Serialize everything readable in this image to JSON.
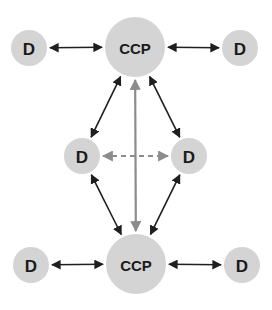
{
  "diagram": {
    "colors": {
      "node_fill": "#d4d4d4",
      "arrow_dark": "#1f1f1f",
      "arrow_gray": "#8c8c8c",
      "background": "#ffffff"
    },
    "nodes": [
      {
        "id": "d-top-left",
        "label": "D",
        "cx": 29,
        "cy": 48,
        "r": 18
      },
      {
        "id": "ccp-top",
        "label": "CCP",
        "cx": 135,
        "cy": 47,
        "r": 30
      },
      {
        "id": "d-top-right",
        "label": "D",
        "cx": 240,
        "cy": 48,
        "r": 18
      },
      {
        "id": "d-mid-left",
        "label": "D",
        "cx": 82,
        "cy": 156,
        "r": 18
      },
      {
        "id": "d-mid-right",
        "label": "D",
        "cx": 189,
        "cy": 156,
        "r": 18
      },
      {
        "id": "d-bottom-left",
        "label": "D",
        "cx": 31,
        "cy": 265,
        "r": 18
      },
      {
        "id": "ccp-bottom",
        "label": "CCP",
        "cx": 136,
        "cy": 264,
        "r": 30
      },
      {
        "id": "d-bottom-right",
        "label": "D",
        "cx": 242,
        "cy": 265,
        "r": 18
      }
    ],
    "edges": [
      {
        "from": "d-top-left",
        "to": "ccp-top",
        "style": "solid-dark",
        "bidirectional": true
      },
      {
        "from": "ccp-top",
        "to": "d-top-right",
        "style": "solid-dark",
        "bidirectional": true
      },
      {
        "from": "ccp-top",
        "to": "d-mid-left",
        "style": "solid-dark",
        "bidirectional": true
      },
      {
        "from": "ccp-top",
        "to": "d-mid-right",
        "style": "solid-dark",
        "bidirectional": true
      },
      {
        "from": "ccp-top",
        "to": "ccp-bottom",
        "style": "solid-gray",
        "bidirectional": true
      },
      {
        "from": "d-mid-left",
        "to": "d-mid-right",
        "style": "dashed-gray",
        "bidirectional": true
      },
      {
        "from": "d-mid-left",
        "to": "ccp-bottom",
        "style": "solid-dark",
        "bidirectional": true
      },
      {
        "from": "d-mid-right",
        "to": "ccp-bottom",
        "style": "solid-dark",
        "bidirectional": true
      },
      {
        "from": "d-bottom-left",
        "to": "ccp-bottom",
        "style": "solid-dark",
        "bidirectional": true
      },
      {
        "from": "ccp-bottom",
        "to": "d-bottom-right",
        "style": "solid-dark",
        "bidirectional": true
      }
    ]
  }
}
